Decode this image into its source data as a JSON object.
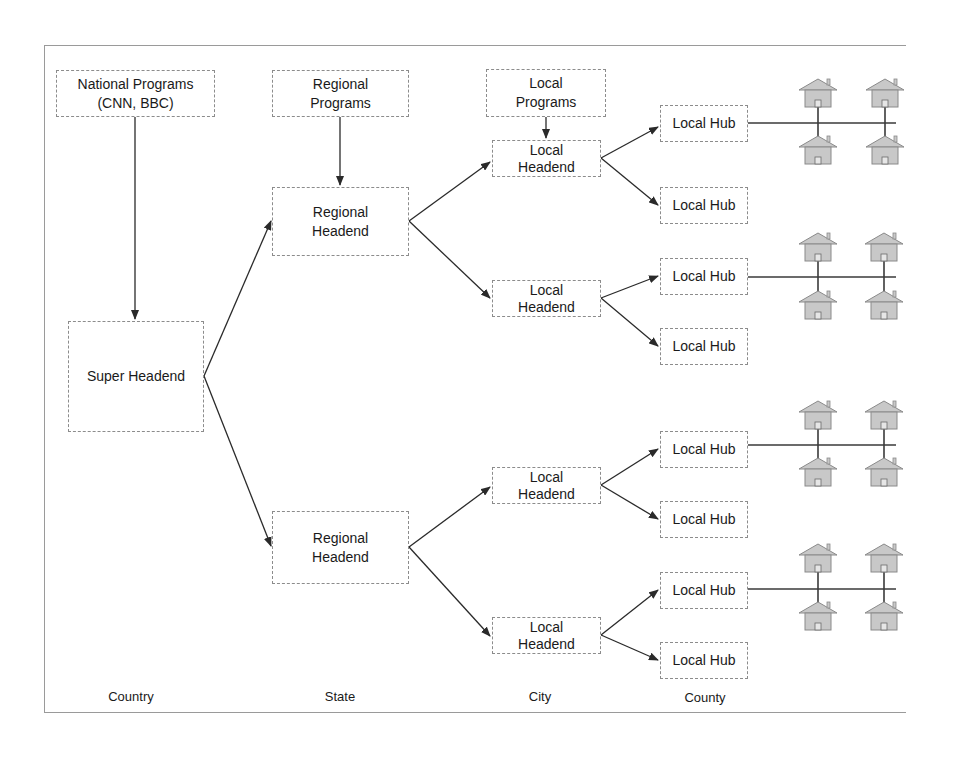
{
  "diagram": {
    "nodes": {
      "national_programs": "National Programs\n(CNN, BBC)",
      "regional_programs": "Regional\nPrograms",
      "local_programs": "Local\nPrograms",
      "super_headend": "Super Headend",
      "regional_headend_1": "Regional\nHeadend",
      "regional_headend_2": "Regional\nHeadend",
      "local_headend_1": "Local\nHeadend",
      "local_headend_2": "Local\nHeadend",
      "local_headend_3": "Local\nHeadend",
      "local_headend_4": "Local\nHeadend",
      "local_hub_1": "Local Hub",
      "local_hub_2": "Local Hub",
      "local_hub_3": "Local Hub",
      "local_hub_4": "Local Hub",
      "local_hub_5": "Local Hub",
      "local_hub_6": "Local Hub",
      "local_hub_7": "Local Hub",
      "local_hub_8": "Local Hub"
    },
    "levels": {
      "country": "Country",
      "state": "State",
      "city": "City",
      "county": "County"
    },
    "house_icon": "house-icon",
    "colors": {
      "line": "#2a2a2a",
      "box_border": "#8c8c8c",
      "house_fill": "#c8c8c8",
      "house_stroke": "#8a8a8a"
    }
  }
}
